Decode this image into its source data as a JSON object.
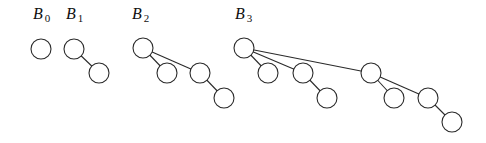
{
  "style": {
    "stroke_color": "#2a2a2a",
    "fill_color": "#ffffff",
    "node_radius": 10
  },
  "trees": [
    {
      "name": "B",
      "subscript": "0",
      "label_pos": [
        33,
        19
      ],
      "nodes": [
        [
          41,
          49
        ]
      ],
      "edges": []
    },
    {
      "name": "B",
      "subscript": "1",
      "label_pos": [
        66,
        19
      ],
      "nodes": [
        [
          74,
          49
        ],
        [
          99,
          73
        ]
      ],
      "edges": [
        [
          0,
          1
        ]
      ]
    },
    {
      "name": "B",
      "subscript": "2",
      "label_pos": [
        132,
        19
      ],
      "nodes": [
        [
          143,
          48
        ],
        [
          167,
          73
        ],
        [
          200,
          73
        ],
        [
          224,
          98
        ]
      ],
      "edges": [
        [
          0,
          1
        ],
        [
          0,
          2
        ],
        [
          2,
          3
        ]
      ]
    },
    {
      "name": "B",
      "subscript": "3",
      "label_pos": [
        235,
        19
      ],
      "nodes": [
        [
          244,
          48
        ],
        [
          268,
          73
        ],
        [
          303,
          73
        ],
        [
          327,
          98
        ],
        [
          371,
          73
        ],
        [
          394,
          98
        ],
        [
          428,
          98
        ],
        [
          452,
          122
        ]
      ],
      "edges": [
        [
          0,
          1
        ],
        [
          0,
          2
        ],
        [
          2,
          3
        ],
        [
          0,
          4
        ],
        [
          4,
          5
        ],
        [
          4,
          6
        ],
        [
          6,
          7
        ]
      ]
    }
  ]
}
